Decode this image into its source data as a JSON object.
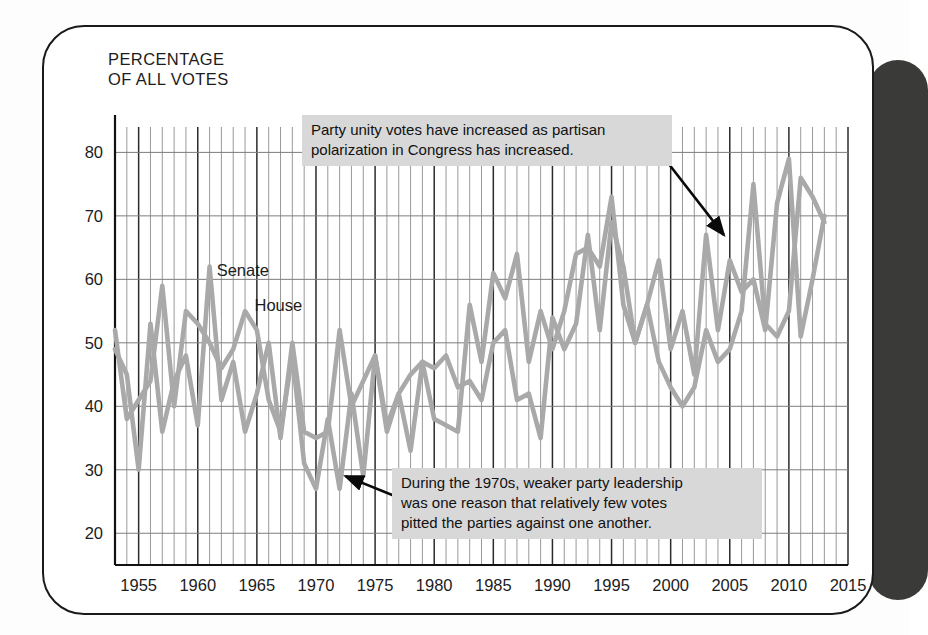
{
  "page": {
    "background_color": "#fdfdfd",
    "card_border_color": "#1a1a1a",
    "edge_tab_color": "#3a3a38"
  },
  "chart_data": {
    "type": "line",
    "title": "",
    "ylabel": "PERCENTAGE\nOF ALL VOTES",
    "xlabel": "",
    "xlim": [
      1953,
      2015
    ],
    "ylim": [
      15,
      84
    ],
    "yticks": [
      20,
      30,
      40,
      50,
      60,
      70,
      80
    ],
    "xticks": [
      1955,
      1960,
      1965,
      1970,
      1975,
      1980,
      1985,
      1990,
      1995,
      2000,
      2005,
      2010,
      2015
    ],
    "grid": true,
    "grid_minor_x": true,
    "legend_position": "inline-labels",
    "line_color": "#a9a9a9",
    "x": [
      1953,
      1954,
      1955,
      1956,
      1957,
      1958,
      1959,
      1960,
      1961,
      1962,
      1963,
      1964,
      1965,
      1966,
      1967,
      1968,
      1969,
      1970,
      1971,
      1972,
      1973,
      1974,
      1975,
      1976,
      1977,
      1978,
      1979,
      1980,
      1981,
      1982,
      1983,
      1984,
      1985,
      1986,
      1987,
      1988,
      1989,
      1990,
      1991,
      1992,
      1993,
      1994,
      1995,
      1996,
      1997,
      1998,
      1999,
      2000,
      2001,
      2002,
      2003,
      2004,
      2005,
      2006,
      2007,
      2008,
      2009,
      2010,
      2011,
      2012,
      2013
    ],
    "series": [
      {
        "name": "Senate",
        "values": [
          49,
          45,
          30,
          53,
          36,
          44,
          48,
          37,
          62,
          41,
          47,
          36,
          42,
          50,
          35,
          50,
          36,
          35,
          36,
          52,
          40,
          44,
          48,
          37,
          42,
          45,
          47,
          46,
          48,
          43,
          44,
          41,
          50,
          52,
          41,
          42,
          35,
          54,
          49,
          53,
          67,
          52,
          69,
          62,
          50,
          56,
          63,
          49,
          55,
          45,
          67,
          52,
          63,
          58,
          60,
          52,
          72,
          79,
          51,
          60,
          70
        ]
      },
      {
        "name": "House",
        "values": [
          52,
          38,
          41,
          44,
          59,
          40,
          55,
          53,
          50,
          46,
          49,
          55,
          52,
          41,
          36,
          48,
          31,
          27,
          38,
          27,
          42,
          29,
          48,
          36,
          42,
          33,
          47,
          38,
          37,
          36,
          56,
          47,
          61,
          57,
          64,
          47,
          55,
          49,
          55,
          64,
          65,
          62,
          73,
          56,
          50,
          56,
          47,
          43,
          40,
          43,
          52,
          47,
          49,
          55,
          75,
          53,
          51,
          55,
          76,
          73,
          69
        ]
      }
    ],
    "annotations": [
      {
        "id": "top-callout",
        "text": "Party unity votes have increased as partisan\npolarization in Congress has increased.",
        "arrow_from": [
          1999.5,
          79
        ],
        "arrow_to": [
          2004.5,
          67
        ]
      },
      {
        "id": "bottom-callout",
        "text": "During the 1970s, weaker party leadership\nwas one reason that relatively few votes\npitted the parties against one another.",
        "arrow_from": [
          1976.5,
          26
        ],
        "arrow_to": [
          1972.5,
          29
        ]
      }
    ]
  }
}
